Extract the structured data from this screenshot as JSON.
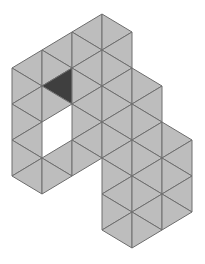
{
  "figure": {
    "colors": {
      "background": "#ffffff",
      "fill": "#bdbdbd",
      "stroke": "#6e6e6e",
      "shaded": "#3f3f3f",
      "hole": "#ffffff"
    },
    "stroke_width": 1,
    "triangle_count": 47,
    "shaded_count": 1,
    "hole_triangle_count": 2
  },
  "triangles": [
    {
      "p": [
        [
          42,
          50
        ],
        [
          12,
          68
        ],
        [
          42,
          86
        ]
      ],
      "s": "fill"
    },
    {
      "p": [
        [
          12,
          68
        ],
        [
          42,
          86
        ],
        [
          12,
          104
        ]
      ],
      "s": "fill"
    },
    {
      "p": [
        [
          12,
          104
        ],
        [
          42,
          86
        ],
        [
          42,
          122
        ]
      ],
      "s": "fill"
    },
    {
      "p": [
        [
          12,
          104
        ],
        [
          42,
          122
        ],
        [
          12,
          140
        ]
      ],
      "s": "fill"
    },
    {
      "p": [
        [
          12,
          140
        ],
        [
          42,
          122
        ],
        [
          42,
          158
        ]
      ],
      "s": "fill"
    },
    {
      "p": [
        [
          12,
          140
        ],
        [
          42,
          158
        ],
        [
          12,
          176
        ]
      ],
      "s": "fill"
    },
    {
      "p": [
        [
          12,
          176
        ],
        [
          42,
          158
        ],
        [
          42,
          194
        ]
      ],
      "s": "fill"
    },
    {
      "p": [
        [
          72,
          32
        ],
        [
          42,
          50
        ],
        [
          72,
          68
        ]
      ],
      "s": "fill"
    },
    {
      "p": [
        [
          42,
          50
        ],
        [
          72,
          68
        ],
        [
          42,
          86
        ]
      ],
      "s": "fill"
    },
    {
      "p": [
        [
          42,
          86
        ],
        [
          72,
          68
        ],
        [
          72,
          104
        ]
      ],
      "s": "shaded"
    },
    {
      "p": [
        [
          42,
          86
        ],
        [
          72,
          104
        ],
        [
          42,
          122
        ]
      ],
      "s": "fill"
    },
    {
      "p": [
        [
          42,
          158
        ],
        [
          72,
          140
        ],
        [
          72,
          176
        ]
      ],
      "s": "fill"
    },
    {
      "p": [
        [
          42,
          158
        ],
        [
          72,
          176
        ],
        [
          42,
          194
        ]
      ],
      "s": "fill"
    },
    {
      "p": [
        [
          102,
          14
        ],
        [
          72,
          32
        ],
        [
          102,
          50
        ]
      ],
      "s": "fill"
    },
    {
      "p": [
        [
          72,
          32
        ],
        [
          102,
          50
        ],
        [
          72,
          68
        ]
      ],
      "s": "fill"
    },
    {
      "p": [
        [
          72,
          68
        ],
        [
          102,
          50
        ],
        [
          102,
          86
        ]
      ],
      "s": "fill"
    },
    {
      "p": [
        [
          72,
          68
        ],
        [
          102,
          86
        ],
        [
          72,
          104
        ]
      ],
      "s": "fill"
    },
    {
      "p": [
        [
          72,
          104
        ],
        [
          102,
          86
        ],
        [
          102,
          122
        ]
      ],
      "s": "fill"
    },
    {
      "p": [
        [
          72,
          104
        ],
        [
          102,
          122
        ],
        [
          72,
          140
        ]
      ],
      "s": "fill"
    },
    {
      "p": [
        [
          72,
          140
        ],
        [
          102,
          122
        ],
        [
          102,
          158
        ]
      ],
      "s": "fill"
    },
    {
      "p": [
        [
          72,
          140
        ],
        [
          102,
          158
        ],
        [
          72,
          176
        ]
      ],
      "s": "fill"
    },
    {
      "p": [
        [
          102,
          14
        ],
        [
          132,
          32
        ],
        [
          102,
          50
        ]
      ],
      "s": "fill"
    },
    {
      "p": [
        [
          102,
          50
        ],
        [
          132,
          32
        ],
        [
          132,
          68
        ]
      ],
      "s": "fill"
    },
    {
      "p": [
        [
          102,
          50
        ],
        [
          132,
          68
        ],
        [
          102,
          86
        ]
      ],
      "s": "fill"
    },
    {
      "p": [
        [
          102,
          86
        ],
        [
          132,
          68
        ],
        [
          132,
          104
        ]
      ],
      "s": "fill"
    },
    {
      "p": [
        [
          102,
          86
        ],
        [
          132,
          104
        ],
        [
          102,
          122
        ]
      ],
      "s": "fill"
    },
    {
      "p": [
        [
          102,
          122
        ],
        [
          132,
          104
        ],
        [
          132,
          140
        ]
      ],
      "s": "fill"
    },
    {
      "p": [
        [
          102,
          122
        ],
        [
          132,
          140
        ],
        [
          102,
          158
        ]
      ],
      "s": "fill"
    },
    {
      "p": [
        [
          102,
          158
        ],
        [
          132,
          140
        ],
        [
          132,
          176
        ]
      ],
      "s": "fill"
    },
    {
      "p": [
        [
          102,
          158
        ],
        [
          132,
          176
        ],
        [
          102,
          194
        ]
      ],
      "s": "fill"
    },
    {
      "p": [
        [
          102,
          194
        ],
        [
          132,
          176
        ],
        [
          132,
          212
        ]
      ],
      "s": "fill"
    },
    {
      "p": [
        [
          102,
          194
        ],
        [
          132,
          212
        ],
        [
          102,
          230
        ]
      ],
      "s": "fill"
    },
    {
      "p": [
        [
          102,
          230
        ],
        [
          132,
          212
        ],
        [
          132,
          248
        ]
      ],
      "s": "fill"
    },
    {
      "p": [
        [
          132,
          68
        ],
        [
          162,
          86
        ],
        [
          132,
          104
        ]
      ],
      "s": "fill"
    },
    {
      "p": [
        [
          132,
          104
        ],
        [
          162,
          86
        ],
        [
          162,
          122
        ]
      ],
      "s": "fill"
    },
    {
      "p": [
        [
          132,
          104
        ],
        [
          162,
          122
        ],
        [
          132,
          140
        ]
      ],
      "s": "fill"
    },
    {
      "p": [
        [
          132,
          140
        ],
        [
          162,
          122
        ],
        [
          162,
          158
        ]
      ],
      "s": "fill"
    },
    {
      "p": [
        [
          132,
          140
        ],
        [
          162,
          158
        ],
        [
          132,
          176
        ]
      ],
      "s": "fill"
    },
    {
      "p": [
        [
          132,
          176
        ],
        [
          162,
          158
        ],
        [
          162,
          194
        ]
      ],
      "s": "fill"
    },
    {
      "p": [
        [
          132,
          176
        ],
        [
          162,
          194
        ],
        [
          132,
          212
        ]
      ],
      "s": "fill"
    },
    {
      "p": [
        [
          132,
          212
        ],
        [
          162,
          194
        ],
        [
          162,
          230
        ]
      ],
      "s": "fill"
    },
    {
      "p": [
        [
          132,
          212
        ],
        [
          162,
          230
        ],
        [
          132,
          248
        ]
      ],
      "s": "fill"
    },
    {
      "p": [
        [
          162,
          122
        ],
        [
          192,
          140
        ],
        [
          162,
          158
        ]
      ],
      "s": "fill"
    },
    {
      "p": [
        [
          162,
          158
        ],
        [
          192,
          140
        ],
        [
          192,
          176
        ]
      ],
      "s": "fill"
    },
    {
      "p": [
        [
          162,
          158
        ],
        [
          192,
          176
        ],
        [
          162,
          194
        ]
      ],
      "s": "fill"
    },
    {
      "p": [
        [
          162,
          194
        ],
        [
          192,
          176
        ],
        [
          192,
          212
        ]
      ],
      "s": "fill"
    },
    {
      "p": [
        [
          162,
          194
        ],
        [
          192,
          212
        ],
        [
          162,
          230
        ]
      ],
      "s": "fill"
    }
  ],
  "hole": [
    [
      42,
      122
    ],
    [
      72,
      104
    ],
    [
      72,
      140
    ],
    [
      42,
      158
    ]
  ]
}
